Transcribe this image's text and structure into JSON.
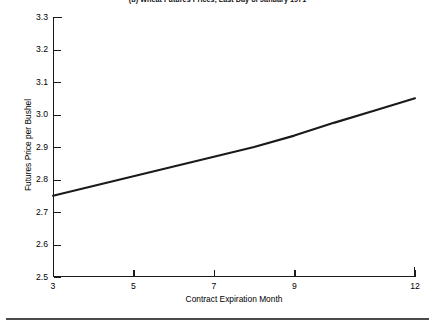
{
  "chart_data": {
    "type": "line",
    "title": "(b) Wheat Futures Prices, Last Day of January 1971",
    "xlabel": "Contract Expiration Month",
    "ylabel": "Futures Price per Bushel",
    "xlim": [
      3,
      12
    ],
    "ylim": [
      2.5,
      3.3
    ],
    "grid": false,
    "legend": null,
    "xticks": [
      3,
      5,
      7,
      9,
      12
    ],
    "xtick_labels": [
      "3",
      "5",
      "7",
      "9",
      "12"
    ],
    "yticks": [
      2.5,
      2.6,
      2.7,
      2.8,
      2.9,
      3.0,
      3.1,
      3.2,
      3.3
    ],
    "ytick_labels": [
      "2.5",
      "2.6",
      "2.7",
      "2.8",
      "2.9",
      "3.0",
      "3.1",
      "3.2",
      "3.3"
    ],
    "series": [
      {
        "name": "Wheat futures price",
        "color": "#1a1a1a",
        "x": [
          3,
          4,
          5,
          6,
          7,
          8,
          9,
          10,
          11,
          12
        ],
        "values": [
          2.75,
          2.78,
          2.81,
          2.84,
          2.87,
          2.9,
          2.935,
          2.975,
          3.012,
          3.05
        ]
      }
    ]
  },
  "axes": {
    "x_tick_count": 5,
    "y_tick_count": 9
  }
}
